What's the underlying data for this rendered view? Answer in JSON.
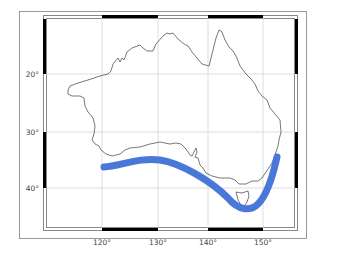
{
  "map": {
    "region": "Australia",
    "projection": "Mercator",
    "extent": {
      "lon_min": 109,
      "lon_max": 156,
      "lat_min": -46,
      "lat_max": -10
    },
    "colors": {
      "band": "#4a78d8",
      "coastline": "#555555",
      "frame": "#000000",
      "grid": "#cccccc",
      "outer_frame": "#999999"
    },
    "longitude_ticks": [
      {
        "label": "120°",
        "x": 102
      },
      {
        "label": "130°",
        "x": 158
      },
      {
        "label": "140°",
        "x": 208
      },
      {
        "label": "150°",
        "x": 263
      }
    ],
    "latitude_ticks": [
      {
        "label": "20°",
        "y": 74
      },
      {
        "label": "30°",
        "y": 132
      },
      {
        "label": "40°",
        "y": 188
      }
    ],
    "band": {
      "description": "Southern Ocean current / storm track band along south coast",
      "path_lonlat": [
        [
          120,
          -35.5
        ],
        [
          125,
          -35
        ],
        [
          130,
          -34.5
        ],
        [
          135,
          -36
        ],
        [
          140,
          -38.5
        ],
        [
          145,
          -43
        ],
        [
          148,
          -41.5
        ],
        [
          150.5,
          -37
        ],
        [
          152,
          -34
        ]
      ]
    }
  }
}
